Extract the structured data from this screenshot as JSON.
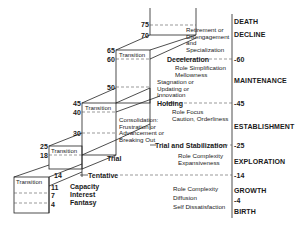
{
  "diagram": {
    "type": "life-career stages staircase",
    "age_markers": {
      "a75": "75",
      "a70": "70",
      "a65": "65",
      "a60": "60",
      "a50": "50",
      "a45": "45",
      "a40": "40",
      "a30": "30",
      "a25": "25",
      "a18": "18",
      "a14": "14",
      "a11": "11",
      "a7": "7",
      "a4": "4"
    },
    "transitions": {
      "t1": "Transition",
      "t2": "Transition",
      "t3": "Transition",
      "t4": "Transition"
    },
    "substages": {
      "retirement": "Retirement or\nDisengagement\nand\nSpecialization",
      "deceleration": "Deceleration",
      "role_simplification": "Role Simplification\nMellowness",
      "stagnation": "Stagnation or\nUpdating or\nInnovation",
      "holding": "Holding",
      "role_focus": "Role Focus\nCaution, Orderliness",
      "consolidation": "Consolidation:\nFrustration or\nAdvancement or\nBreaking Out",
      "trial_stabilization": "Trial and Stabilization",
      "trial": "Trial",
      "role_complexity_exp": "Role Complexity\nExpansiveness",
      "tentative": "Tentative",
      "capacity": "Capacity",
      "interest": "Interest",
      "fantasy": "Fantasy",
      "role_complexity_growth": "Role Complexity\nDiffusion\nSelf Dissatisfaction"
    },
    "axis": {
      "death": "DEATH",
      "decline": "DECLINE",
      "tick60": "-60",
      "maintenance": "MAINTENANCE",
      "tick45": "-45",
      "establishment": "ESTABLISHMENT",
      "tick25": "-25",
      "exploration": "EXPLORATION",
      "tick14": "-14",
      "growth": "GROWTH",
      "tick4": "-4",
      "birth": "BIRTH"
    }
  }
}
